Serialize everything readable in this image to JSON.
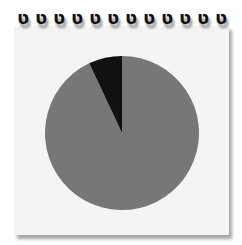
{
  "notepad": {
    "ring_count": 12,
    "ring_glyph": "ט"
  },
  "chart_data": {
    "type": "pie",
    "title": "",
    "slices": [
      {
        "label": "",
        "value": 93,
        "color": "#777777"
      },
      {
        "label": "",
        "value": 7,
        "color": "#111111"
      }
    ],
    "center": [
      122,
      133
    ],
    "radius": 77,
    "start_angle_deg": -90,
    "legend": "none"
  }
}
